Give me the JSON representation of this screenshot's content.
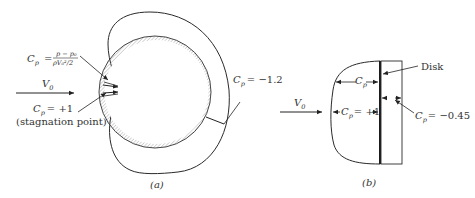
{
  "figure": {
    "panel_a": {
      "caption": "(a)",
      "formula_lhs": "C",
      "formula_lhs_sub": "p",
      "formula_eq": "=",
      "formula_num": "p − p₀",
      "formula_den": "ρV₀²/2",
      "velocity_label": "V",
      "velocity_sub": "0",
      "stagnation_cp": "C",
      "stagnation_cp_sub": "p",
      "stagnation_value": "= +1",
      "stagnation_note": "(stagnation point)",
      "min_cp": "C",
      "min_cp_sub": "p",
      "min_value": "= −1.2"
    },
    "panel_b": {
      "caption": "(b)",
      "disk_label": "Disk",
      "velocity_label": "V",
      "velocity_sub": "0",
      "cp_label": "C",
      "cp_sub": "p",
      "center_cp": "C",
      "center_cp_sub": "p",
      "center_value": "= +1",
      "rear_cp": "C",
      "rear_cp_sub": "p",
      "rear_value": "= −0.45"
    },
    "colors": {
      "line": "#2a2a2a",
      "hatch": "#9a9a9a"
    }
  }
}
